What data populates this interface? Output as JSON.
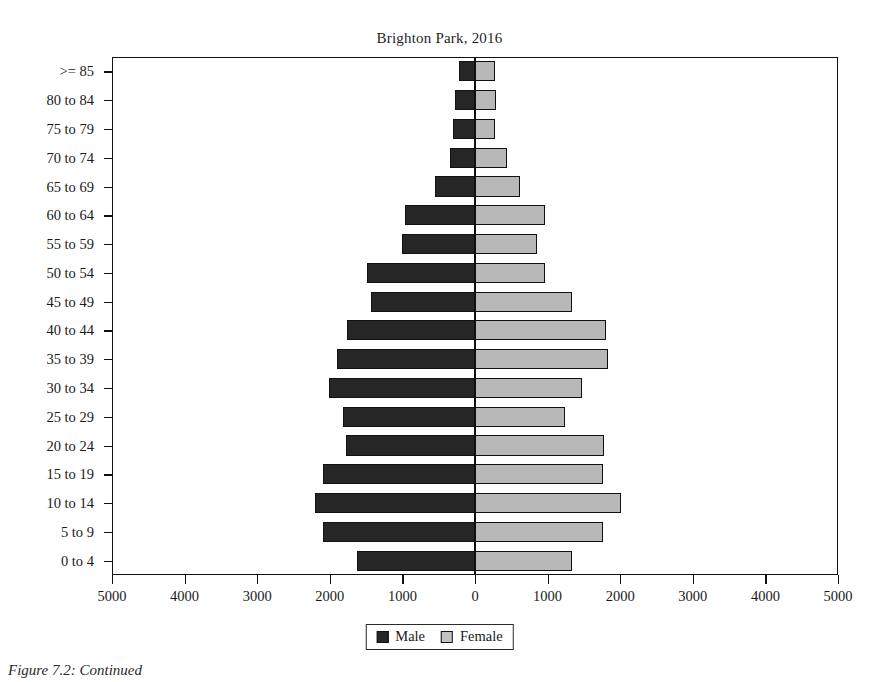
{
  "figure": {
    "title": "Brighton Park, 2016",
    "caption": "Figure 7.2: Continued"
  },
  "legend": {
    "position": "bottom-center",
    "entries": [
      {
        "label": "Male",
        "color": "#262626",
        "swatch": "male-swatch"
      },
      {
        "label": "Female",
        "color": "#c2c2c2",
        "swatch": "female-swatch"
      }
    ]
  },
  "axes": {
    "x_ticklabels": [
      "5000",
      "4000",
      "3000",
      "2000",
      "1000",
      "0",
      "1000",
      "2000",
      "3000",
      "4000",
      "5000"
    ],
    "x_tickvalues": [
      -5000,
      -4000,
      -3000,
      -2000,
      -1000,
      0,
      1000,
      2000,
      3000,
      4000,
      5000
    ],
    "x_min": -5000,
    "x_max": 5000,
    "xlabel": "",
    "ylabel": "",
    "grid": false
  },
  "chart_data": {
    "type": "bar",
    "subtype": "population-pyramid",
    "title": "Brighton Park, 2016",
    "xlabel": "",
    "ylabel": "",
    "xlim": [
      -5000,
      5000
    ],
    "grid": false,
    "legend_position": "bottom-center",
    "categories": [
      ">= 85",
      "80 to 84",
      "75 to 79",
      "70 to 74",
      "65 to 69",
      "60 to 64",
      "55 to 59",
      "50 to 54",
      "45 to 49",
      "40 to 44",
      "35 to 39",
      "30 to 34",
      "25 to 29",
      "20 to 24",
      "15 to 19",
      "10 to 14",
      "5 to 9",
      "0 to 4"
    ],
    "series": [
      {
        "name": "Male",
        "color": "#262626",
        "direction": "left",
        "values": [
          220,
          280,
          300,
          350,
          545,
          965,
          1000,
          1490,
          1430,
          1760,
          1900,
          2010,
          1820,
          1770,
          2100,
          2200,
          2100,
          1625
        ]
      },
      {
        "name": "Female",
        "color": "#c2c2c2",
        "direction": "right",
        "values": [
          270,
          290,
          280,
          440,
          625,
          970,
          860,
          960,
          1340,
          1805,
          1830,
          1470,
          1240,
          1775,
          1760,
          2010,
          1760,
          1330
        ]
      }
    ]
  }
}
